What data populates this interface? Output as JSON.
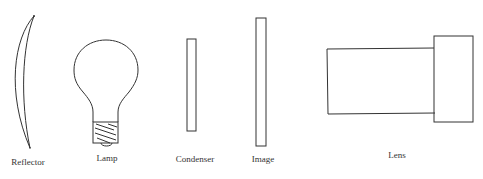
{
  "diagram": {
    "components": [
      {
        "id": "reflector",
        "label": "Reflector",
        "shape": "crescent-mirror"
      },
      {
        "id": "lamp",
        "label": "Lamp",
        "shape": "light-bulb"
      },
      {
        "id": "condenser",
        "label": "Condenser",
        "shape": "thin-rectangle"
      },
      {
        "id": "image",
        "label": "Image",
        "shape": "tall-thin-rectangle"
      },
      {
        "id": "lens",
        "label": "Lens",
        "shape": "two-rectangle-barrel"
      }
    ],
    "colors": {
      "stroke": "#333333",
      "background": "#ffffff",
      "label": "#333333"
    }
  }
}
